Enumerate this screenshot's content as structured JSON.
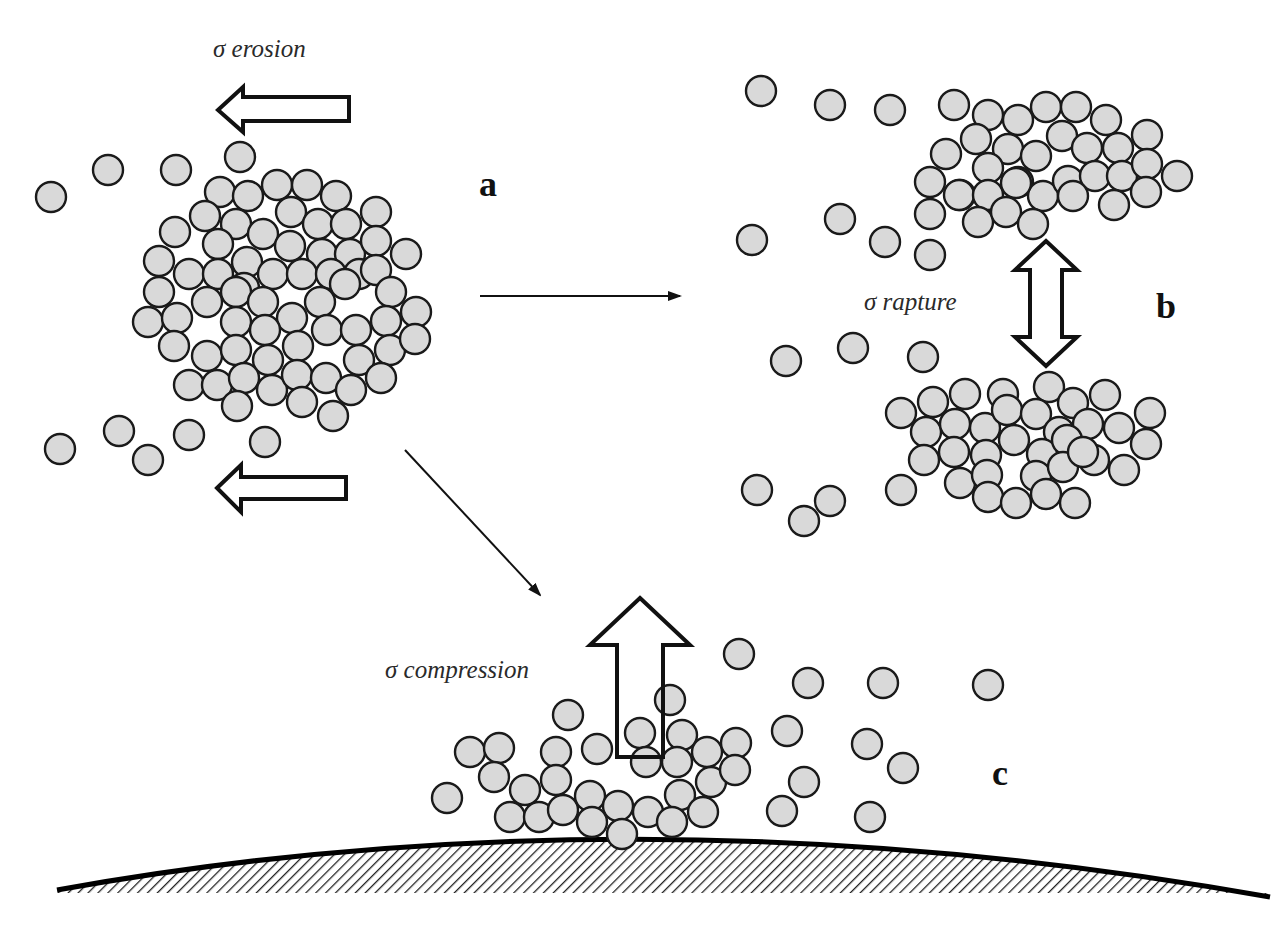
{
  "diagram": {
    "panels": [
      {
        "id": "a",
        "label": "a",
        "label_pos": [
          490,
          196
        ],
        "mechanism": "σ erosion"
      },
      {
        "id": "b",
        "label": "b",
        "label_pos": [
          1168,
          318
        ],
        "mechanism": "σ rapture"
      },
      {
        "id": "c",
        "label": "c",
        "label_pos": [
          1002,
          785
        ],
        "mechanism": "σ compression"
      }
    ],
    "labels": {
      "erosion": "σ erosion",
      "rapture": "σ rapture",
      "compression": "σ compression",
      "panel_a": "a",
      "panel_b": "b",
      "panel_c": "c"
    },
    "colors": {
      "particle_fill": "#d9d9d9",
      "particle_stroke": "#1a1a1a",
      "line": "#111111",
      "background": "#ffffff"
    },
    "particle_radius": 15,
    "particles": {
      "cluster_a": [
        [
          220,
          192
        ],
        [
          248,
          196
        ],
        [
          277,
          185
        ],
        [
          307,
          185
        ],
        [
          336,
          196
        ],
        [
          376,
          212
        ],
        [
          205,
          216
        ],
        [
          236,
          224
        ],
        [
          263,
          234
        ],
        [
          291,
          212
        ],
        [
          318,
          224
        ],
        [
          346,
          224
        ],
        [
          175,
          232
        ],
        [
          218,
          244
        ],
        [
          247,
          262
        ],
        [
          290,
          246
        ],
        [
          322,
          254
        ],
        [
          350,
          254
        ],
        [
          376,
          241
        ],
        [
          406,
          254
        ],
        [
          159,
          261
        ],
        [
          189,
          274
        ],
        [
          218,
          274
        ],
        [
          244,
          288
        ],
        [
          273,
          274
        ],
        [
          302,
          274
        ],
        [
          331,
          274
        ],
        [
          359,
          274
        ],
        [
          376,
          270
        ],
        [
          159,
          292
        ],
        [
          207,
          302
        ],
        [
          236,
          292
        ],
        [
          263,
          302
        ],
        [
          292,
          318
        ],
        [
          320,
          302
        ],
        [
          345,
          284
        ],
        [
          391,
          292
        ],
        [
          148,
          322
        ],
        [
          177,
          318
        ],
        [
          236,
          322
        ],
        [
          265,
          330
        ],
        [
          327,
          330
        ],
        [
          356,
          330
        ],
        [
          386,
          321
        ],
        [
          416,
          312
        ],
        [
          174,
          346
        ],
        [
          207,
          356
        ],
        [
          236,
          350
        ],
        [
          268,
          360
        ],
        [
          298,
          346
        ],
        [
          359,
          360
        ],
        [
          390,
          350
        ],
        [
          415,
          339
        ],
        [
          189,
          385
        ],
        [
          217,
          385
        ],
        [
          244,
          378
        ],
        [
          272,
          390
        ],
        [
          297,
          375
        ],
        [
          326,
          378
        ],
        [
          351,
          390
        ],
        [
          381,
          378
        ],
        [
          237,
          406
        ],
        [
          302,
          402
        ],
        [
          333,
          416
        ]
      ],
      "free_a": [
        [
          51,
          197
        ],
        [
          108,
          170
        ],
        [
          176,
          170
        ],
        [
          240,
          157
        ],
        [
          60,
          449
        ],
        [
          119,
          431
        ],
        [
          148,
          460
        ],
        [
          189,
          435
        ],
        [
          265,
          442
        ]
      ],
      "cluster_b_top": [
        [
          954,
          105
        ],
        [
          988,
          115
        ],
        [
          1018,
          120
        ],
        [
          1046,
          107
        ],
        [
          1076,
          107
        ],
        [
          1106,
          120
        ],
        [
          946,
          154
        ],
        [
          976,
          139
        ],
        [
          1008,
          149
        ],
        [
          1036,
          156
        ],
        [
          1062,
          136
        ],
        [
          1087,
          148
        ],
        [
          1118,
          148
        ],
        [
          1147,
          135
        ],
        [
          930,
          182
        ],
        [
          960,
          195
        ],
        [
          988,
          168
        ],
        [
          1018,
          182
        ],
        [
          1043,
          196
        ],
        [
          1068,
          181
        ],
        [
          1095,
          176
        ],
        [
          1122,
          176
        ],
        [
          1147,
          164
        ],
        [
          1177,
          176
        ],
        [
          930,
          214
        ],
        [
          959,
          195
        ],
        [
          988,
          195
        ],
        [
          1016,
          183
        ],
        [
          1073,
          196
        ],
        [
          1114,
          205
        ],
        [
          1146,
          192
        ],
        [
          978,
          222
        ],
        [
          1006,
          212
        ],
        [
          1033,
          224
        ]
      ],
      "free_b_top": [
        [
          761,
          91
        ],
        [
          830,
          105
        ],
        [
          890,
          110
        ],
        [
          840,
          219
        ],
        [
          752,
          240
        ],
        [
          885,
          242
        ],
        [
          930,
          255
        ]
      ],
      "cluster_b_bottom": [
        [
          901,
          413
        ],
        [
          933,
          402
        ],
        [
          965,
          394
        ],
        [
          1003,
          394
        ],
        [
          1049,
          387
        ],
        [
          1073,
          403
        ],
        [
          1105,
          395
        ],
        [
          926,
          432
        ],
        [
          955,
          424
        ],
        [
          985,
          428
        ],
        [
          1007,
          410
        ],
        [
          1036,
          414
        ],
        [
          1059,
          432
        ],
        [
          1088,
          424
        ],
        [
          1119,
          428
        ],
        [
          1150,
          413
        ],
        [
          924,
          460
        ],
        [
          954,
          452
        ],
        [
          986,
          455
        ],
        [
          1014,
          440
        ],
        [
          1042,
          454
        ],
        [
          1067,
          440
        ],
        [
          1094,
          460
        ],
        [
          1146,
          444
        ],
        [
          960,
          483
        ],
        [
          987,
          475
        ],
        [
          1036,
          476
        ],
        [
          1063,
          467
        ],
        [
          1083,
          452
        ],
        [
          1124,
          470
        ],
        [
          988,
          497
        ],
        [
          1016,
          503
        ],
        [
          1046,
          494
        ],
        [
          1075,
          503
        ]
      ],
      "free_b_bottom": [
        [
          786,
          361
        ],
        [
          853,
          348
        ],
        [
          923,
          357
        ],
        [
          757,
          490
        ],
        [
          830,
          501
        ],
        [
          804,
          521
        ],
        [
          901,
          490
        ]
      ],
      "cluster_c": [
        [
          568,
          715
        ],
        [
          670,
          700
        ],
        [
          739,
          654
        ],
        [
          470,
          752
        ],
        [
          499,
          748
        ],
        [
          556,
          752
        ],
        [
          597,
          749
        ],
        [
          640,
          733
        ],
        [
          682,
          735
        ],
        [
          707,
          752
        ],
        [
          736,
          743
        ],
        [
          494,
          777
        ],
        [
          525,
          790
        ],
        [
          556,
          780
        ],
        [
          646,
          762
        ],
        [
          677,
          762
        ],
        [
          711,
          782
        ],
        [
          735,
          770
        ],
        [
          447,
          798
        ],
        [
          510,
          817
        ],
        [
          539,
          817
        ],
        [
          563,
          810
        ],
        [
          590,
          796
        ],
        [
          618,
          806
        ],
        [
          648,
          812
        ],
        [
          680,
          795
        ],
        [
          703,
          812
        ],
        [
          592,
          822
        ],
        [
          622,
          834
        ],
        [
          672,
          822
        ]
      ],
      "free_c": [
        [
          808,
          683
        ],
        [
          883,
          683
        ],
        [
          988,
          685
        ],
        [
          787,
          731
        ],
        [
          867,
          744
        ],
        [
          903,
          768
        ],
        [
          804,
          782
        ],
        [
          782,
          811
        ],
        [
          870,
          817
        ]
      ]
    },
    "block_arrows": [
      {
        "name": "erosion-arrow-upper",
        "direction": "left",
        "points": "218,110 243,87 243,97 349,97 349,121 243,121 243,132"
      },
      {
        "name": "erosion-arrow-lower",
        "direction": "left",
        "points": "217,488 241,465 241,477 346,477 346,499 241,499 241,512"
      },
      {
        "name": "rapture-arrow",
        "direction": "up-down",
        "points": "1046,241 1077,270 1062,270 1062,337 1077,337 1046,366 1015,337 1030,337 1030,270 1015,270"
      },
      {
        "name": "compression-arrow",
        "direction": "up",
        "points": "640,598 690,645 663,645 663,757 617,757 617,645 590,645"
      }
    ],
    "thin_arrows": [
      {
        "name": "transition-arrow-a-to-b",
        "x1": 480,
        "y1": 296,
        "x2": 680,
        "y2": 296
      },
      {
        "name": "transition-arrow-a-to-c",
        "x1": 405,
        "y1": 450,
        "x2": 540,
        "y2": 595
      }
    ],
    "ground": {
      "curve": "M 57 890 Q 640 785 1270 897",
      "hatch_bottom": 893
    }
  }
}
